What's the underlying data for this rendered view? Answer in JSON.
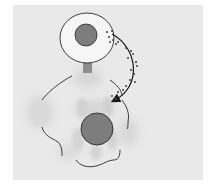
{
  "figure": {
    "title": "",
    "labels": [],
    "elements": {
      "top_cell": {
        "shape": "ellipse",
        "has_nucleus": true
      },
      "connector_stalk": {
        "shape": "rectangle"
      },
      "bottom_cell": {
        "shape": "irregular-lobed",
        "has_nucleus": true,
        "shaded_regions": true
      },
      "transfer_arrow": {
        "direction": "top-cell-to-bottom-cell",
        "particles": true
      }
    }
  },
  "colors": {
    "background": "#ffffff",
    "panel": "#e9e9e9",
    "top_cell_fill": "#f6f6f6",
    "outline": "#2a2a2a",
    "nucleus_fill": "#7d7d7d",
    "stalk_fill": "#8c8c8c",
    "shading": "#d4d4d4",
    "arrow": "#1a1a1a",
    "particles": "#444444"
  }
}
